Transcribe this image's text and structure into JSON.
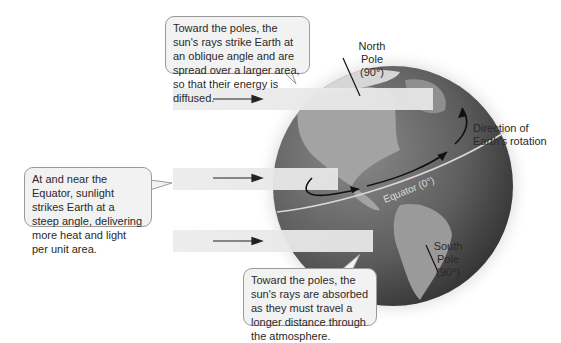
{
  "diagram": {
    "topic": "Sunlight intensity and latitude",
    "callouts": {
      "top": "Toward the poles, the sun's rays strike Earth at an oblique angle and are spread over a larger area, so that their energy is diffused.",
      "left": "At and near the Equator, sunlight strikes Earth at a steep angle, delivering more heat and light per unit area.",
      "bottom": "Toward the poles, the sun's rays are absorbed as they must travel a longer distance through the atmosphere."
    },
    "labels": {
      "north_pole_line1": "North",
      "north_pole_line2": "Pole",
      "north_pole_line3": "(90°)",
      "south_pole_line1": "South",
      "south_pole_line2": "Pole",
      "south_pole_line3": "(90°)",
      "rotation_line1": "Direction of",
      "rotation_line2": "Earth's rotation",
      "equator": "Equator (0°)"
    },
    "beams": [
      {
        "name": "upper-beam",
        "y": 88
      },
      {
        "name": "middle-beam",
        "y": 168
      },
      {
        "name": "lower-beam",
        "y": 230
      }
    ],
    "colors": {
      "beam": "#ebebeb",
      "ocean": "#5a5a5a",
      "land": "#9a9a9a",
      "bubble_fill": "#f2f2f2",
      "bubble_border": "#9a9a9a"
    }
  }
}
